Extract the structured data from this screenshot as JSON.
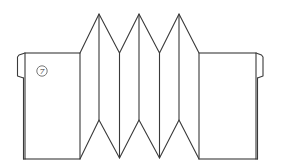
{
  "diagram": {
    "label": {
      "text": "7",
      "glyph": "⑦",
      "style": "circled-number"
    },
    "colors": {
      "line": "#3a3a3a",
      "background": "#ffffff"
    },
    "parts": [
      {
        "name": "left-panel",
        "description": "flat end panel with tab on left edge"
      },
      {
        "name": "accordion-folds",
        "description": "six zigzag folded panels"
      },
      {
        "name": "right-panel",
        "description": "flat end panel with tab on right edge"
      }
    ]
  }
}
